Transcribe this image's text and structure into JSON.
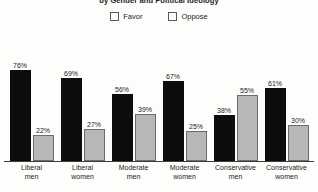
{
  "chart_data": {
    "type": "bar",
    "title": "by Gender and Political Ideology",
    "xlabel": "",
    "ylabel": "",
    "ylim": [
      0,
      100
    ],
    "grid": false,
    "legend_position": "top-center",
    "categories": [
      "Liberal men",
      "Liberal women",
      "Moderate men",
      "Moderate women",
      "Conservative men",
      "Conservative women"
    ],
    "category_lines": [
      [
        "Liberal",
        "men"
      ],
      [
        "Liberal",
        "women"
      ],
      [
        "Moderate",
        "men"
      ],
      [
        "Moderate",
        "women"
      ],
      [
        "Conservative",
        "men"
      ],
      [
        "Conservative",
        "women"
      ]
    ],
    "series": [
      {
        "name": "Favor",
        "color": "#0d0d0d",
        "values": [
          76,
          69,
          56,
          67,
          38,
          61
        ],
        "labels": [
          "76%",
          "69%",
          "56%",
          "67%",
          "38%",
          "61%"
        ]
      },
      {
        "name": "Oppose",
        "color": "#b7b7b7",
        "values": [
          22,
          27,
          39,
          25,
          55,
          30
        ],
        "labels": [
          "22%",
          "27%",
          "39%",
          "25%",
          "55%",
          "30%"
        ]
      }
    ]
  },
  "legend": {
    "items": [
      {
        "label": "Favor",
        "color": "#0d0d0d"
      },
      {
        "label": "Oppose",
        "color": "#b7b7b7"
      }
    ]
  }
}
